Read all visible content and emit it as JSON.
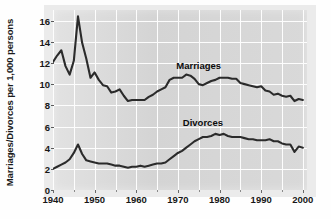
{
  "chart_data": {
    "type": "line",
    "title": "",
    "xlabel": "",
    "ylabel": "Marriages/Divorces per 1,000 persons",
    "xlim": [
      1940,
      2001
    ],
    "ylim": [
      0,
      17
    ],
    "grid": true,
    "legend_position": "inline-annotation",
    "y_ticks": [
      0,
      2,
      4,
      6,
      8,
      10,
      12,
      14,
      16
    ],
    "y_tick_labels": [
      "0",
      "2",
      "4",
      "6",
      "8",
      "10",
      "12",
      "14",
      "16"
    ],
    "x_ticks": [
      1940,
      1950,
      1960,
      1970,
      1980,
      1990,
      2000
    ],
    "x_tick_labels": [
      "1940",
      "1950",
      "1960",
      "1970",
      "1980",
      "1990",
      "2000"
    ],
    "x_minor_ticks": [
      1945,
      1955,
      1965,
      1975,
      1985,
      1995
    ],
    "annotations": [
      {
        "text": "Marriages",
        "x": 1975,
        "y": 11.8
      },
      {
        "text": "Divorces",
        "x": 1976,
        "y": 6.4
      }
    ],
    "x": [
      1940,
      1941,
      1942,
      1943,
      1944,
      1945,
      1946,
      1947,
      1948,
      1949,
      1950,
      1951,
      1952,
      1953,
      1954,
      1955,
      1956,
      1957,
      1958,
      1959,
      1960,
      1961,
      1962,
      1963,
      1964,
      1965,
      1966,
      1967,
      1968,
      1969,
      1970,
      1971,
      1972,
      1973,
      1974,
      1975,
      1976,
      1977,
      1978,
      1979,
      1980,
      1981,
      1982,
      1983,
      1984,
      1985,
      1986,
      1987,
      1988,
      1989,
      1990,
      1991,
      1992,
      1993,
      1994,
      1995,
      1996,
      1997,
      1998,
      1999,
      2000
    ],
    "series": [
      {
        "name": "Marriages",
        "color": "#2b2b2b",
        "values": [
          12.1,
          12.7,
          13.2,
          11.7,
          10.9,
          12.2,
          16.4,
          13.9,
          12.4,
          10.6,
          11.1,
          10.4,
          9.9,
          9.8,
          9.2,
          9.3,
          9.5,
          8.9,
          8.4,
          8.5,
          8.5,
          8.5,
          8.5,
          8.8,
          9.0,
          9.3,
          9.5,
          9.7,
          10.4,
          10.6,
          10.6,
          10.6,
          10.9,
          10.8,
          10.5,
          10.0,
          9.9,
          10.1,
          10.3,
          10.4,
          10.6,
          10.6,
          10.6,
          10.5,
          10.5,
          10.1,
          10.0,
          9.9,
          9.8,
          9.7,
          9.8,
          9.4,
          9.3,
          9.0,
          9.1,
          8.9,
          8.8,
          8.9,
          8.4,
          8.6,
          8.5
        ]
      },
      {
        "name": "Divorces",
        "color": "#2b2b2b",
        "values": [
          2.0,
          2.2,
          2.4,
          2.6,
          2.9,
          3.5,
          4.3,
          3.4,
          2.8,
          2.7,
          2.6,
          2.5,
          2.5,
          2.5,
          2.4,
          2.3,
          2.3,
          2.2,
          2.1,
          2.2,
          2.2,
          2.3,
          2.2,
          2.3,
          2.4,
          2.5,
          2.5,
          2.6,
          2.9,
          3.2,
          3.5,
          3.7,
          4.0,
          4.3,
          4.6,
          4.8,
          5.0,
          5.0,
          5.1,
          5.3,
          5.2,
          5.3,
          5.1,
          5.0,
          5.0,
          5.0,
          4.9,
          4.8,
          4.8,
          4.7,
          4.7,
          4.7,
          4.8,
          4.6,
          4.6,
          4.4,
          4.3,
          4.3,
          3.6,
          4.1,
          4.0
        ]
      }
    ]
  }
}
